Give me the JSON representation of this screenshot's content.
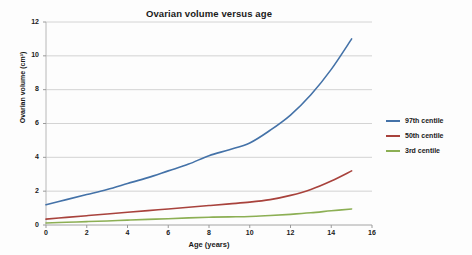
{
  "chart_data": {
    "type": "line",
    "title": "Ovarian volume versus age",
    "xlabel": "Age (years)",
    "ylabel": "Ovarian volume (cm³)",
    "xlim": [
      0,
      16
    ],
    "ylim": [
      0,
      12
    ],
    "xticks": [
      0,
      2,
      4,
      6,
      8,
      10,
      12,
      14,
      16
    ],
    "yticks": [
      0,
      2,
      4,
      6,
      8,
      10,
      12
    ],
    "grid": "horizontal",
    "legend_position": "right",
    "x": [
      0,
      1,
      2,
      3,
      4,
      5,
      6,
      7,
      8,
      9,
      10,
      11,
      12,
      13,
      14,
      15
    ],
    "series": [
      {
        "name": "97th centile",
        "color": "#4472a8",
        "values": [
          1.2,
          1.5,
          1.8,
          2.1,
          2.45,
          2.8,
          3.2,
          3.6,
          4.1,
          4.45,
          4.85,
          5.6,
          6.5,
          7.7,
          9.2,
          11.0
        ]
      },
      {
        "name": "50th centile",
        "color": "#a8423c",
        "values": [
          0.35,
          0.45,
          0.55,
          0.65,
          0.75,
          0.85,
          0.95,
          1.05,
          1.15,
          1.25,
          1.35,
          1.5,
          1.75,
          2.1,
          2.6,
          3.2
        ]
      },
      {
        "name": "3rd centile",
        "color": "#8caf54",
        "values": [
          0.12,
          0.16,
          0.2,
          0.24,
          0.29,
          0.33,
          0.37,
          0.42,
          0.46,
          0.48,
          0.5,
          0.56,
          0.63,
          0.72,
          0.84,
          0.95
        ]
      }
    ]
  },
  "legend": {
    "items": [
      {
        "label": "97th centile",
        "color": "#4472a8"
      },
      {
        "label": "50th centile",
        "color": "#a8423c"
      },
      {
        "label": "3rd centile",
        "color": "#8caf54"
      }
    ]
  },
  "axes": {
    "y_tick_labels": [
      "0",
      "2",
      "4",
      "6",
      "8",
      "10",
      "12"
    ],
    "x_tick_labels": [
      "0",
      "2",
      "4",
      "6",
      "8",
      "10",
      "12",
      "14",
      "16"
    ]
  }
}
